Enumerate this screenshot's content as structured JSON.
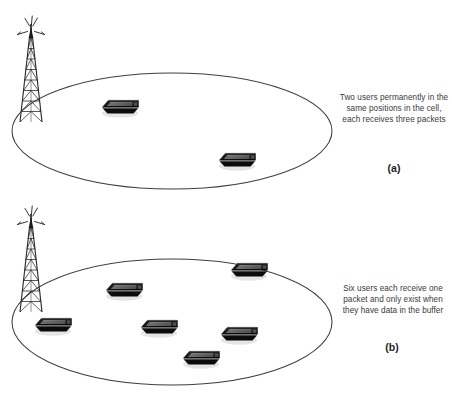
{
  "figure": {
    "background_color": "#ffffff",
    "stroke_color": "#3f3f3f",
    "device_color": "#1a1a1a",
    "text_color": "#3a3a3a"
  },
  "panels": [
    {
      "id": "a",
      "label": "(a)",
      "caption": "Two users permanently in the same positions in the cell, each receives three packets",
      "cell": {
        "shape": "ellipse",
        "center_x": 172,
        "center_y": 131,
        "radius_x": 160,
        "radius_y": 58
      },
      "tower": {
        "name": "base-station-tower",
        "base_x": 31,
        "base_y": 122,
        "height": 98
      },
      "users": [
        {
          "name": "mobile-device",
          "x": 120,
          "y": 107,
          "packets": 3
        },
        {
          "name": "mobile-device",
          "x": 237,
          "y": 160,
          "packets": 3
        }
      ],
      "user_count": 2,
      "packets_per_user": 3
    },
    {
      "id": "b",
      "label": "(b)",
      "caption": "Six users each receive one packet and only exist when they have data in the buffer",
      "cell": {
        "shape": "ellipse",
        "center_x": 172,
        "center_y": 322,
        "radius_x": 160,
        "radius_y": 63
      },
      "tower": {
        "name": "base-station-tower",
        "base_x": 31,
        "base_y": 312,
        "height": 98
      },
      "users": [
        {
          "name": "mobile-device",
          "x": 53,
          "y": 325,
          "packets": 1
        },
        {
          "name": "mobile-device",
          "x": 124,
          "y": 290,
          "packets": 1
        },
        {
          "name": "mobile-device",
          "x": 159,
          "y": 327,
          "packets": 1
        },
        {
          "name": "mobile-device",
          "x": 201,
          "y": 358,
          "packets": 1
        },
        {
          "name": "mobile-device",
          "x": 239,
          "y": 334,
          "packets": 1
        },
        {
          "name": "mobile-device",
          "x": 249,
          "y": 270,
          "packets": 1
        }
      ],
      "user_count": 6,
      "packets_per_user": 1
    }
  ]
}
